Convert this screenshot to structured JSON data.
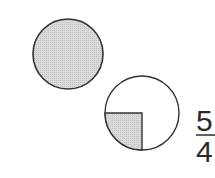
{
  "diagram": {
    "whole_circle": {
      "shaded_fraction": "1",
      "fill_color": "#d6d6d6",
      "stroke_color": "#333333"
    },
    "partial_circle": {
      "shaded_fraction": "1/4",
      "shaded_quadrant": "lower-left",
      "fill_color": "#d6d6d6",
      "stroke_color": "#333333"
    },
    "fraction": {
      "numerator": "5",
      "denominator": "4"
    }
  }
}
